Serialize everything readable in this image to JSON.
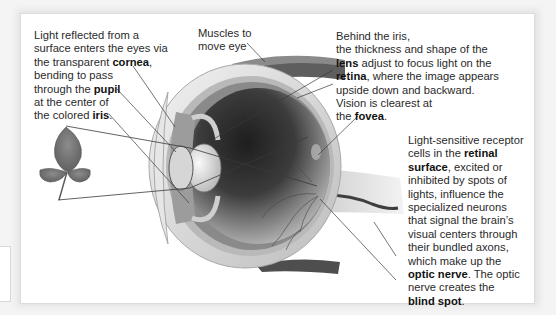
{
  "diagram": {
    "labels": {
      "cornea_block": {
        "lines": [
          [
            "Light reflected from a"
          ],
          [
            "surface enters the eyes via"
          ],
          [
            "the transparent ",
            {
              "b": "cornea"
            },
            ","
          ],
          [
            "bending to pass"
          ],
          [
            "through the ",
            {
              "b": "pupil"
            }
          ],
          [
            "at the center of"
          ],
          [
            "the colored ",
            {
              "b": "iris"
            },
            "."
          ]
        ]
      },
      "muscles_block": {
        "lines": [
          [
            "Muscles to"
          ],
          [
            "move eye"
          ]
        ]
      },
      "lens_block": {
        "lines": [
          [
            "Behind the iris,"
          ],
          [
            "the thickness and shape of the"
          ],
          [
            {
              "b": "lens"
            },
            " adjust to focus light on the"
          ],
          [
            {
              "b": "retina"
            },
            ", where the image appears"
          ],
          [
            "upside down and backward."
          ],
          [
            "Vision is clearest at"
          ],
          [
            "the ",
            {
              "b": "fovea"
            },
            "."
          ]
        ]
      },
      "optic_block": {
        "lines": [
          [
            "Light-sensitive receptor"
          ],
          [
            "cells in the ",
            {
              "b": "retinal"
            }
          ],
          [
            {
              "b": "surface"
            },
            ", excited or"
          ],
          [
            "inhibited by spots of"
          ],
          [
            "lights, influence the"
          ],
          [
            "specialized neurons"
          ],
          [
            "that signal the brain’s"
          ],
          [
            "visual centers through"
          ],
          [
            "their bundled axons,"
          ],
          [
            "which make up the"
          ],
          [
            {
              "b": "optic nerve"
            },
            ". The optic"
          ],
          [
            "nerve creates the"
          ],
          [
            {
              "b": "blind spot"
            },
            "."
          ]
        ]
      }
    },
    "structures": [
      "cornea",
      "pupil",
      "iris",
      "muscles",
      "lens",
      "retina",
      "fovea",
      "retinal surface",
      "optic nerve",
      "blind spot",
      "leaf (object viewed)"
    ],
    "colors": {
      "panel": "#ffffff",
      "text": "#2a2a2a",
      "leader_line": "#3a3a3a",
      "sclera": "#d9d9d9",
      "vitreous_dark": "#2b2b2b",
      "vessel": "#4a4a4a"
    }
  }
}
